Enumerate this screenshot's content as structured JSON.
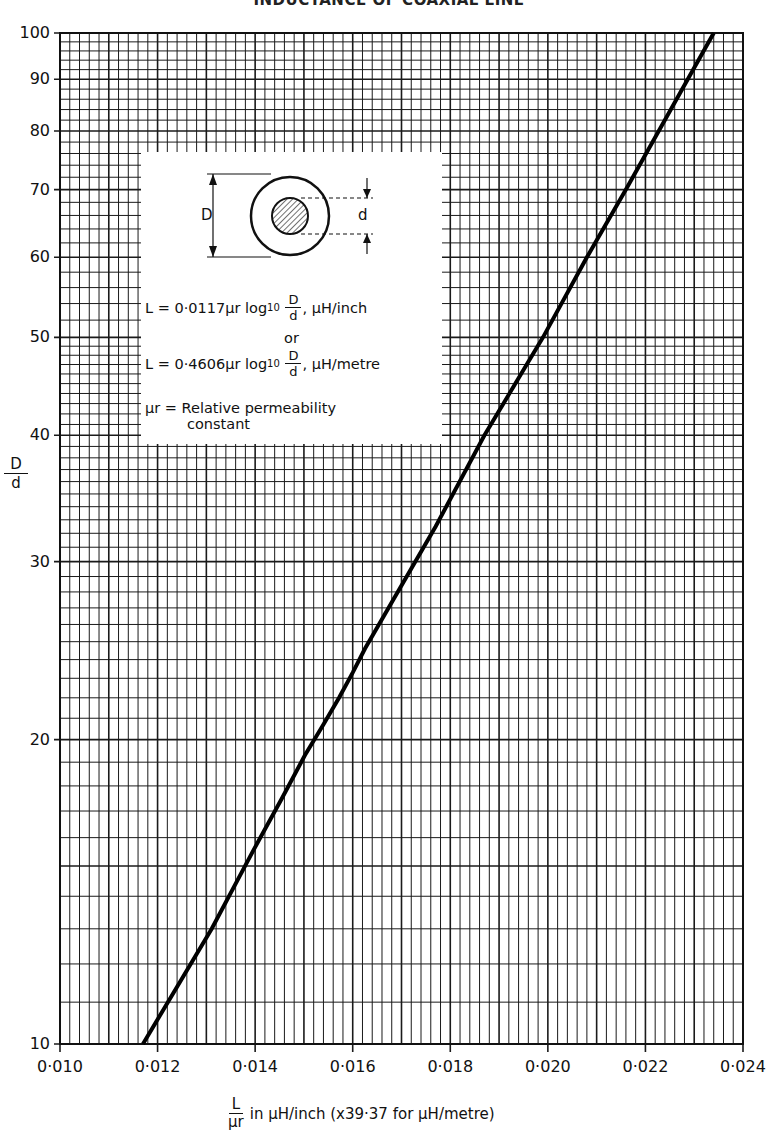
{
  "title": "INDUCTANCE OF COAXIAL LINE",
  "chart_data": {
    "type": "line",
    "title": "INDUCTANCE OF COAXIAL LINE",
    "xlabel": "L/μr in μH/inch (x39·37 for μH/metre)",
    "ylabel": "D/d",
    "xscale": "linear",
    "yscale": "log",
    "xlim": [
      0.01,
      0.024
    ],
    "ylim": [
      10,
      100
    ],
    "grid": true,
    "x_ticks": [
      "0·010",
      "0·012",
      "0·014",
      "0·016",
      "0·018",
      "0·020",
      "0·022",
      "0·024"
    ],
    "y_ticks": [
      "10",
      "20",
      "30",
      "40",
      "50",
      "60",
      "70",
      "80",
      "90",
      "100"
    ],
    "series": [
      {
        "name": "L = 0·0117 μr log10 D/d",
        "x": [
          0.0117,
          0.01311,
          0.01395,
          0.01455,
          0.01502,
          0.0154,
          0.01572,
          0.016,
          0.01625,
          0.0177,
          0.0187,
          0.0199,
          0.0208,
          0.0216,
          0.0234
        ],
        "y": [
          10,
          13,
          15.5,
          17.5,
          19.3,
          20.7,
          22,
          23.3,
          24.6,
          32.5,
          40,
          50,
          60,
          70,
          100
        ]
      }
    ]
  },
  "axes": {
    "y_label_num": "D",
    "y_label_den": "d",
    "x_label_num": "L",
    "x_label_den": "μr",
    "x_label_rest": "in μH/inch  (x39·37 for μH/metre)"
  },
  "inset": {
    "outer_label": "D",
    "inner_label": "d",
    "formula1_prefix": "L = 0·0117μr log",
    "formula1_sub": "10",
    "formula1_suffix": ", μH/inch",
    "or": "or",
    "formula2_prefix": "L = 0·4606μr log",
    "formula2_sub": "10",
    "formula2_suffix": ", μH/metre",
    "frac_num": "D",
    "frac_den": "d",
    "perm_line1": "μr = Relative permeability",
    "perm_line2": "constant"
  }
}
